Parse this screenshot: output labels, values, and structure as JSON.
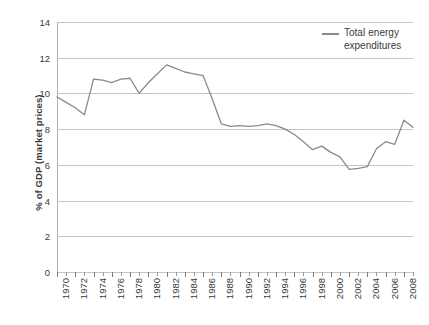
{
  "chart_data": {
    "type": "line",
    "title": "",
    "xlabel": "",
    "ylabel": "% of GDP (market prices)",
    "ylim": [
      0,
      14
    ],
    "ytick_step": 2,
    "yticks": [
      14,
      12,
      10,
      8,
      6,
      4,
      2,
      0
    ],
    "grid": true,
    "legend_position": "top-right",
    "xlim": [
      1970,
      2009
    ],
    "xtick_labels": [
      "1970",
      "1972",
      "1974",
      "1976",
      "1978",
      "1980",
      "1982",
      "1984",
      "1986",
      "1988",
      "1990",
      "1992",
      "1994",
      "1996",
      "1998",
      "2000",
      "2002",
      "2004",
      "2006",
      "2008"
    ],
    "series": [
      {
        "name": "Total energy expenditures",
        "color": "#8a8a8a",
        "x": [
          1970,
          1971,
          1972,
          1973,
          1974,
          1975,
          1976,
          1977,
          1978,
          1979,
          1980,
          1981,
          1982,
          1983,
          1984,
          1985,
          1986,
          1987,
          1988,
          1989,
          1990,
          1991,
          1992,
          1993,
          1994,
          1995,
          1996,
          1997,
          1998,
          1999,
          2000,
          2001,
          2002,
          2003,
          2004,
          2005,
          2006,
          2007,
          2008,
          2009
        ],
        "values": [
          9.8,
          9.5,
          9.2,
          8.8,
          10.8,
          10.75,
          10.6,
          10.8,
          10.85,
          10.0,
          10.6,
          11.1,
          11.6,
          11.4,
          11.2,
          11.1,
          11.0,
          9.7,
          8.3,
          8.15,
          8.2,
          8.15,
          8.2,
          8.3,
          8.2,
          8.0,
          7.7,
          7.3,
          6.85,
          7.05,
          6.7,
          6.45,
          5.75,
          5.8,
          5.9,
          6.9,
          7.3,
          7.15,
          8.5,
          8.1
        ]
      }
    ]
  },
  "legend": {
    "label": "Total energy expenditures"
  },
  "axes": {
    "y_title": "% of GDP (market prices)"
  }
}
